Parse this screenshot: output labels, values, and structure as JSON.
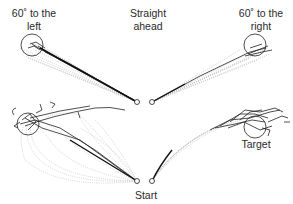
{
  "figure": {
    "labels": {
      "left_line1": "60˚ to the",
      "left_line2": "left",
      "straight_line1": "Straight",
      "straight_line2": "ahead",
      "right_line1": "60˚ to the",
      "right_line2": "right",
      "target": "Target",
      "start": "Start"
    },
    "panels": [
      {
        "id": "top-left",
        "condition": "60° to the left",
        "start": [
          137,
          102
        ],
        "target": [
          32,
          45
        ],
        "target_radius": 11
      },
      {
        "id": "top-right",
        "condition": "60° to the right",
        "start": [
          152,
          102
        ],
        "target": [
          255,
          45
        ],
        "target_radius": 11
      },
      {
        "id": "bottom-left",
        "condition": "curved trajectories left",
        "start": [
          137,
          181
        ],
        "target": [
          28,
          124
        ],
        "target_radius": 11
      },
      {
        "id": "bottom-right",
        "condition": "curved trajectories right",
        "start": [
          152,
          181
        ],
        "target": [
          255,
          127
        ],
        "target_radius": 11
      }
    ],
    "colors": {
      "stroke": "#222222",
      "dotted": "#9a9a9a",
      "text": "#2a2a2a"
    }
  }
}
